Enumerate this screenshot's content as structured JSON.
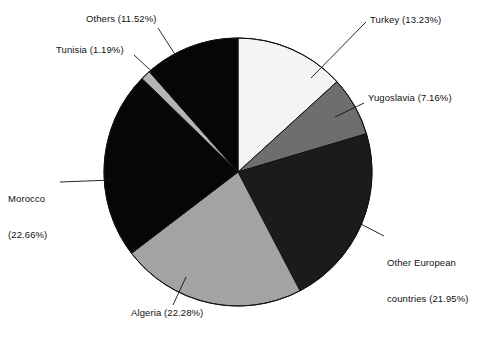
{
  "chart_data": {
    "type": "pie",
    "title": "",
    "xlabel": "",
    "ylabel": "",
    "unit": "%",
    "start_angle_deg": 0,
    "direction": "clockwise",
    "legend": "none",
    "labels_position": "outside-with-leader-lines",
    "categories": [
      "Turkey",
      "Yugoslavia",
      "Other European countries",
      "Algeria",
      "Morocco",
      "Tunisia",
      "Others"
    ],
    "values": [
      13.23,
      7.16,
      21.95,
      22.28,
      22.66,
      1.19,
      11.52
    ],
    "slices": [
      {
        "name": "Turkey",
        "label": "Turkey (13.23%)",
        "value": 13.23,
        "color": "#f4f4f4",
        "stroke": "#111111"
      },
      {
        "name": "Yugoslavia",
        "label": "Yugoslavia (7.16%)",
        "value": 7.16,
        "color": "#6e6e6e",
        "stroke": "#111111"
      },
      {
        "name": "Other European countries",
        "label_line1": "Other European",
        "label_line2": "countries (21.95%)",
        "label": "Other European countries (21.95%)",
        "value": 21.95,
        "color": "#1b1b1b",
        "stroke": "#111111"
      },
      {
        "name": "Algeria",
        "label": "Algeria (22.28%)",
        "value": 22.28,
        "color": "#a3a3a3",
        "stroke": "#111111"
      },
      {
        "name": "Morocco",
        "label_line1": "Morocco",
        "label_line2": "(22.66%)",
        "label": "Morocco (22.66%)",
        "value": 22.66,
        "color": "#060606",
        "stroke": "#111111"
      },
      {
        "name": "Tunisia",
        "label": "Tunisia (1.19%)",
        "value": 1.19,
        "color": "#b4b4b4",
        "stroke": "#111111"
      },
      {
        "name": "Others",
        "label": "Others (11.52%)",
        "value": 11.52,
        "color": "#060606",
        "stroke": "#111111"
      }
    ]
  },
  "figure": {
    "background": "#ffffff",
    "center_x": 238,
    "center_y": 172,
    "radius": 134,
    "leader_line_color": "#111111"
  }
}
